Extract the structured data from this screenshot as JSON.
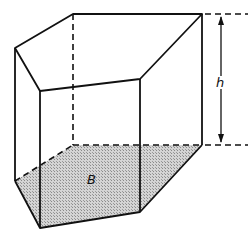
{
  "diagram": {
    "labels": {
      "base": "B",
      "height": "h"
    },
    "colors": {
      "stroke": "#111111",
      "base_fill": "#bdbdbd",
      "background": "#ffffff"
    },
    "vertices": {
      "top": [
        [
          15,
          48
        ],
        [
          73,
          14
        ],
        [
          202,
          14
        ],
        [
          140,
          79
        ],
        [
          40,
          91
        ]
      ],
      "bottom": [
        [
          15,
          181
        ],
        [
          73,
          145
        ],
        [
          202,
          145
        ],
        [
          140,
          212
        ],
        [
          40,
          228
        ]
      ]
    }
  }
}
